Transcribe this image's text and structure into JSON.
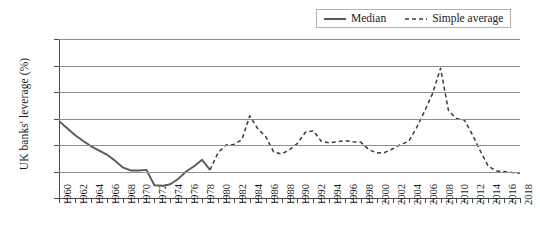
{
  "chart_data": {
    "type": "line",
    "title": "",
    "xlabel": "",
    "ylabel": "UK banks' leverage (%)",
    "xlim": [
      1960,
      2018
    ],
    "ylim": [
      10,
      40
    ],
    "yticks": [
      10,
      15,
      20,
      25,
      30,
      35,
      40
    ],
    "grid": true,
    "legend_position": "top-right",
    "xticks": [
      1960,
      1962,
      1964,
      1966,
      1968,
      1970,
      1972,
      1974,
      1976,
      1978,
      1980,
      1982,
      1984,
      1986,
      1988,
      1990,
      1992,
      1994,
      1996,
      1998,
      2000,
      2002,
      2004,
      2006,
      2008,
      2010,
      2012,
      2014,
      2016,
      2018
    ],
    "series": [
      {
        "name": "Median",
        "style": "solid",
        "color": "#595959",
        "x": [
          1960,
          1961,
          1962,
          1963,
          1964,
          1965,
          1966,
          1967,
          1968,
          1969,
          1970,
          1971,
          1972,
          1973,
          1974,
          1975,
          1976,
          1977,
          1978,
          1979
        ],
        "values": [
          24.5,
          23.2,
          21.9,
          20.8,
          19.8,
          19.0,
          18.2,
          17.1,
          15.8,
          15.2,
          15.2,
          15.3,
          12.4,
          12.3,
          12.6,
          13.6,
          15.0,
          16.0,
          17.2,
          15.3
        ]
      },
      {
        "name": "Simple average",
        "style": "dashed",
        "color": "#3a3a3a",
        "x": [
          1979,
          1980,
          1981,
          1982,
          1983,
          1984,
          1985,
          1986,
          1987,
          1988,
          1989,
          1990,
          1991,
          1992,
          1993,
          1994,
          1995,
          1996,
          1997,
          1998,
          1999,
          2000,
          2001,
          2002,
          2003,
          2004,
          2005,
          2006,
          2007,
          2008,
          2009,
          2010,
          2011,
          2012,
          2013,
          2014,
          2015,
          2016,
          2017,
          2018
        ],
        "values": [
          15.3,
          18.5,
          20.0,
          20.1,
          21.0,
          25.5,
          23.1,
          21.6,
          18.7,
          18.3,
          19.1,
          20.3,
          22.4,
          22.7,
          20.7,
          20.4,
          20.6,
          20.8,
          20.6,
          20.5,
          19.1,
          18.5,
          18.6,
          19.3,
          20.1,
          20.7,
          23.3,
          26.4,
          29.7,
          34.5,
          26.5,
          25.0,
          24.7,
          22.0,
          18.9,
          16.0,
          15.1,
          15.0,
          14.8,
          14.7
        ]
      }
    ]
  },
  "legend": {
    "items": [
      {
        "label": "Median",
        "style": "solid"
      },
      {
        "label": "Simple average",
        "style": "dashed"
      }
    ]
  }
}
